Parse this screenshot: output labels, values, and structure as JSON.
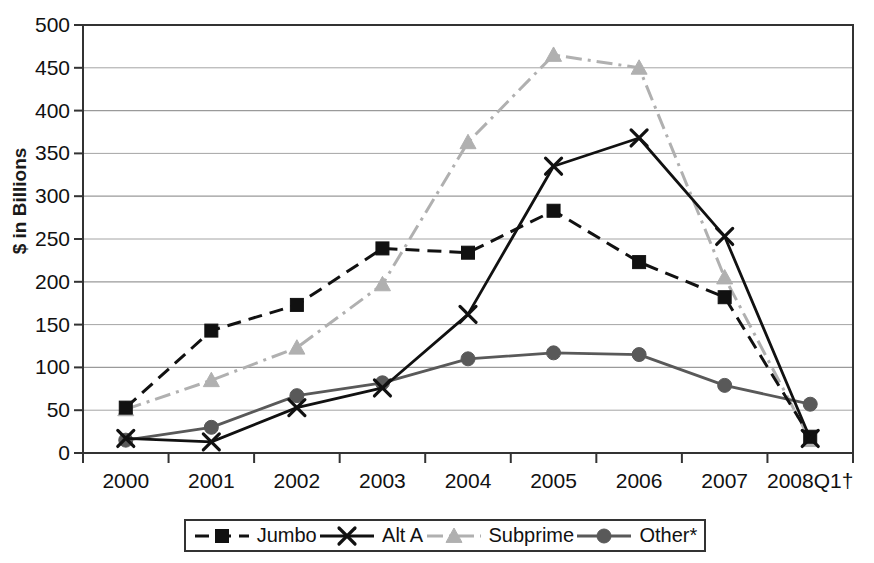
{
  "chart_data": {
    "type": "line",
    "title": "",
    "xlabel": "",
    "ylabel": "$ in Billions",
    "categories": [
      "2000",
      "2001",
      "2002",
      "2003",
      "2004",
      "2005",
      "2006",
      "2007",
      "2008Q1†"
    ],
    "ylim": [
      0,
      500
    ],
    "yticks": [
      0,
      50,
      100,
      150,
      200,
      250,
      300,
      350,
      400,
      450,
      500
    ],
    "ytick_labels": [
      "0",
      "50",
      "100",
      "150",
      "200",
      "250",
      "300",
      "350",
      "400",
      "450",
      "500"
    ],
    "grid": true,
    "legend_position": "bottom",
    "series": [
      {
        "name": "Jumbo",
        "values": [
          53,
          143,
          173,
          239,
          234,
          283,
          223,
          182,
          19
        ],
        "color": "#111111",
        "line_style": "dashed",
        "marker": "square"
      },
      {
        "name": "Alt A",
        "values": [
          17,
          13,
          53,
          76,
          162,
          335,
          368,
          253,
          17
        ],
        "color": "#111111",
        "line_style": "solid",
        "marker": "x"
      },
      {
        "name": "Subprime",
        "values": [
          51,
          85,
          123,
          197,
          363,
          465,
          450,
          205,
          15
        ],
        "color": "#b0b0b0",
        "line_style": "dashdot",
        "marker": "triangle"
      },
      {
        "name": "Other*",
        "values": [
          15,
          30,
          67,
          82,
          110,
          117,
          115,
          79,
          57
        ],
        "color": "#595959",
        "line_style": "solid",
        "marker": "circle"
      }
    ]
  },
  "legend": {
    "entries": [
      {
        "label": "Jumbo"
      },
      {
        "label": "Alt A"
      },
      {
        "label": "Subprime"
      },
      {
        "label": "Other*"
      }
    ]
  }
}
